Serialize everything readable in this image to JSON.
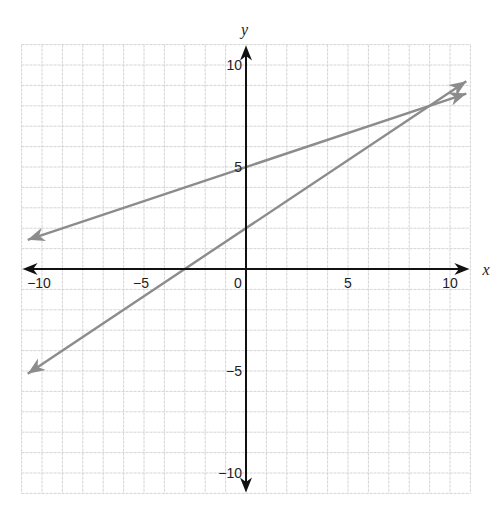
{
  "chart_data": {
    "type": "line",
    "title": "",
    "xlabel": "x",
    "ylabel": "y",
    "xlim": [
      -11,
      11
    ],
    "ylim": [
      -11,
      11
    ],
    "grid": true,
    "x_ticks": [
      -10,
      -5,
      0,
      5,
      10
    ],
    "y_ticks": [
      10,
      5,
      -5,
      -10
    ],
    "x_tick_labels": [
      "−10",
      "−5",
      "0",
      "5",
      "10"
    ],
    "y_tick_labels": [
      "10",
      "5",
      "−5",
      "−10"
    ],
    "series": [
      {
        "name": "line 1",
        "equation": "y = (1/3)x + 5",
        "slope": 0.3333,
        "intercept": 5,
        "x": [
          -10.7,
          10.8
        ],
        "y": [
          1.43,
          8.6
        ],
        "color": "#8c8c8c",
        "arrows": "both"
      },
      {
        "name": "line 2",
        "equation": "y = (2/3)x + 2",
        "slope": 0.6667,
        "intercept": 2,
        "x": [
          -10.7,
          10.8
        ],
        "y": [
          -5.13,
          9.2
        ],
        "color": "#8c8c8c",
        "arrows": "both"
      }
    ],
    "intersection": [
      9,
      8
    ],
    "legend": null
  },
  "colors": {
    "axis": "#111111",
    "grid": "#d4d4d4",
    "line": "#8c8c8c"
  }
}
